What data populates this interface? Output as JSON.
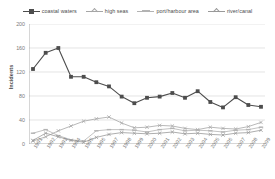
{
  "chart_data": {
    "type": "line",
    "title": "",
    "xlabel": "",
    "ylabel": "Incidents",
    "ylim": [
      0,
      200
    ],
    "yticks": [
      0,
      40,
      80,
      120,
      160,
      200
    ],
    "grid": true,
    "legend_position": "top",
    "categories": [
      "1991",
      "1992",
      "1993",
      "1994",
      "1995",
      "1996",
      "1997",
      "1998",
      "1999",
      "2000",
      "2001",
      "2002",
      "2003",
      "2004",
      "2005",
      "2006",
      "2007",
      "2008",
      "2009"
    ],
    "series": [
      {
        "name": "coastal waters",
        "color": "#4d4d4d",
        "marker": "square",
        "values": [
          125,
          152,
          160,
          112,
          112,
          103,
          96,
          79,
          68,
          77,
          79,
          85,
          77,
          88,
          70,
          61,
          78,
          65,
          62
        ]
      },
      {
        "name": "high seas",
        "color": "#a6a6a6",
        "marker": "cross",
        "values": [
          5,
          12,
          22,
          30,
          38,
          42,
          45,
          35,
          27,
          28,
          31,
          30,
          26,
          24,
          28,
          26,
          25,
          29,
          36
        ]
      },
      {
        "name": "port/harbour area",
        "color": "#b3b3b3",
        "marker": "dash",
        "values": [
          18,
          24,
          14,
          7,
          5,
          22,
          24,
          24,
          23,
          20,
          24,
          26,
          22,
          23,
          22,
          20,
          23,
          24,
          28
        ]
      },
      {
        "name": "river/canal",
        "color": "#999999",
        "marker": "cross",
        "values": [
          6,
          18,
          12,
          6,
          3,
          11,
          16,
          19,
          18,
          17,
          18,
          20,
          17,
          18,
          16,
          15,
          18,
          19,
          23
        ]
      }
    ]
  },
  "legend": {
    "items": [
      {
        "label": "coastal waters"
      },
      {
        "label": "high seas"
      },
      {
        "label": "port/harbour area"
      },
      {
        "label": "river/canal"
      }
    ]
  },
  "axes": {
    "y_title": "Incidents"
  }
}
